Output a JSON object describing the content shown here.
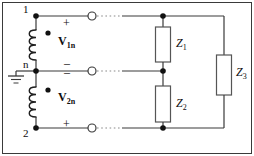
{
  "figure": {
    "name": "two-source-three-impedance-network",
    "background": "#ffffff",
    "border_color": "#3a3a3a",
    "wire_color": "#3a3a3a",
    "node_color": "#111111",
    "terminal_fill": "#ffffff",
    "component_stroke": "#555555"
  },
  "nodes": [
    {
      "id": "node-1",
      "label": "1",
      "x": 36,
      "y": 16
    },
    {
      "id": "node-n",
      "label": "n",
      "x": 36,
      "y": 71
    },
    {
      "id": "node-2",
      "label": "2",
      "x": 36,
      "y": 128
    }
  ],
  "sources": [
    {
      "id": "source-v1n",
      "label": "V",
      "sub": "1n",
      "top_sign": "+",
      "bottom_sign": "–",
      "dot": true
    },
    {
      "id": "source-v2n",
      "label": "V",
      "sub": "2n",
      "top_sign": "–",
      "bottom_sign": "+",
      "dot": true
    }
  ],
  "impedances": [
    {
      "id": "z1",
      "label": "Z",
      "sub": "1"
    },
    {
      "id": "z2",
      "label": "Z",
      "sub": "2"
    },
    {
      "id": "z3",
      "label": "Z",
      "sub": "3"
    }
  ],
  "terminals": [
    {
      "id": "terminal-1",
      "x": 92,
      "y": 16
    },
    {
      "id": "terminal-n",
      "x": 92,
      "y": 71
    },
    {
      "id": "terminal-2",
      "x": 92,
      "y": 128
    }
  ],
  "ground": {
    "id": "ground-symbol",
    "x": 14,
    "y": 71
  }
}
